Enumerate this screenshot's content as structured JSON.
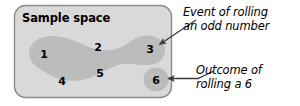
{
  "figure": {
    "sample_space_label": "Sample space",
    "outcomes": [
      {
        "id": "outcome-1",
        "value": "1",
        "in_event": true
      },
      {
        "id": "outcome-2",
        "value": "2",
        "in_event": false
      },
      {
        "id": "outcome-3",
        "value": "3",
        "in_event": true
      },
      {
        "id": "outcome-4",
        "value": "4",
        "in_event": false
      },
      {
        "id": "outcome-5",
        "value": "5",
        "in_event": true
      },
      {
        "id": "outcome-6",
        "value": "6",
        "in_event": false
      }
    ],
    "callouts": [
      {
        "id": "callout-event",
        "line1": "Event of rolling",
        "line2": "an odd number"
      },
      {
        "id": "callout-outcome",
        "line1": "Outcome of",
        "line2": "rolling a 6"
      }
    ],
    "colors": {
      "page_background": "#ffffff",
      "sample_space_fill": "#d9d9d9",
      "sample_space_border": "#8c8c8c",
      "event_region_fill": "#bcbcbc",
      "outcome_region_fill": "#bcbcbc",
      "text": "#000000",
      "arrow": "#3a3a3a"
    }
  }
}
